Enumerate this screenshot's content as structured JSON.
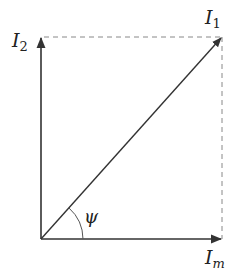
{
  "diagram": {
    "type": "phasor-diagram",
    "origin": [
      41,
      239
    ],
    "vectors": [
      {
        "name": "I_m",
        "base": "I",
        "sub": "m",
        "tip": [
          222,
          239
        ],
        "label_pos": [
          220,
          264
        ]
      },
      {
        "name": "I_2",
        "base": "I",
        "sub": "2",
        "tip": [
          41,
          37
        ],
        "label_pos": [
          12,
          46
        ]
      },
      {
        "name": "I_1",
        "base": "I",
        "sub": "1",
        "tip": [
          222,
          37
        ],
        "label_pos": [
          210,
          24
        ]
      }
    ],
    "angle": {
      "symbol": "ψ",
      "radius": 42,
      "label_pos": [
        86,
        222
      ]
    },
    "projections": "dashed",
    "colors": {
      "vector": "#333333",
      "dashed": "#888888",
      "text": "#222222"
    }
  }
}
